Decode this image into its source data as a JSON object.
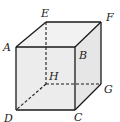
{
  "diagram": {
    "colors": {
      "face": "#ececec",
      "edge": "#1a1a1a",
      "hidden": "#1a1a1a",
      "label": "#222222"
    },
    "vertices": {
      "A": {
        "x": 16,
        "y": 47
      },
      "B": {
        "x": 75,
        "y": 47
      },
      "C": {
        "x": 75,
        "y": 110
      },
      "D": {
        "x": 16,
        "y": 110
      },
      "E": {
        "x": 46,
        "y": 22
      },
      "F": {
        "x": 101,
        "y": 22
      },
      "G": {
        "x": 101,
        "y": 84
      },
      "H": {
        "x": 46,
        "y": 84
      }
    },
    "labels": {
      "A": "A",
      "B": "B",
      "C": "C",
      "D": "D",
      "E": "E",
      "F": "F",
      "G": "G",
      "H": "H"
    },
    "visible_edges": [
      "AB",
      "BC",
      "CD",
      "DA",
      "AE",
      "EF",
      "FB",
      "FG",
      "GC"
    ],
    "hidden_edges": [
      "EH",
      "HG",
      "HD"
    ]
  }
}
